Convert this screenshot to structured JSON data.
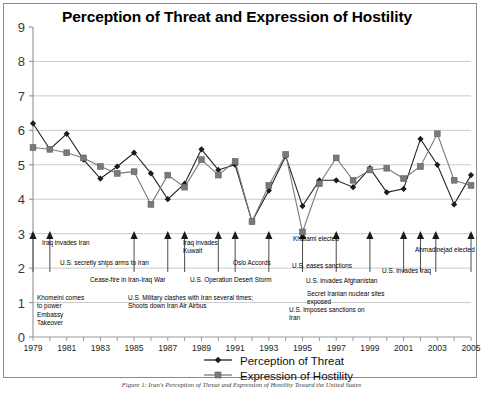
{
  "chart_data": {
    "type": "line",
    "title": "Perception of Threat and Expression of Hostility",
    "xlabel": "",
    "ylabel": "",
    "ylim": [
      0,
      9
    ],
    "xlim": [
      1979,
      2005
    ],
    "grid": true,
    "legend_position": "bottom",
    "yticks": [
      "0",
      "1",
      "2",
      "3",
      "4",
      "5",
      "6",
      "7",
      "8",
      "9"
    ],
    "xticks": [
      "1979",
      "1981",
      "1983",
      "1985",
      "1987",
      "1989",
      "1991",
      "1993",
      "1995",
      "1997",
      "1999",
      "2001",
      "2003",
      "2005"
    ],
    "x": [
      1979,
      1980,
      1981,
      1982,
      1983,
      1984,
      1985,
      1986,
      1987,
      1988,
      1989,
      1990,
      1991,
      1992,
      1993,
      1994,
      1995,
      1996,
      1997,
      1998,
      1999,
      2000,
      2001,
      2002,
      2003,
      2004,
      2005
    ],
    "series": [
      {
        "name": "Perception of Threat",
        "marker": "diamond",
        "color": "#222222",
        "values": [
          6.2,
          5.45,
          5.9,
          5.15,
          4.6,
          4.95,
          5.35,
          4.75,
          4.0,
          4.45,
          5.45,
          4.85,
          5.0,
          3.35,
          4.25,
          5.25,
          3.8,
          4.55,
          4.55,
          4.35,
          4.9,
          4.2,
          4.3,
          5.75,
          5.0,
          3.85,
          4.7
        ]
      },
      {
        "name": "Expression of Hostility",
        "marker": "square",
        "color": "#7a7a7a",
        "values": [
          5.5,
          5.45,
          5.35,
          5.2,
          4.95,
          4.75,
          4.8,
          3.85,
          4.7,
          4.35,
          5.15,
          4.7,
          5.1,
          3.35,
          4.4,
          5.3,
          3.05,
          4.45,
          5.2,
          4.55,
          4.85,
          4.9,
          4.6,
          4.95,
          5.9,
          4.55,
          4.4
        ]
      }
    ],
    "annotations": [
      {
        "label": "Iraq invades Iran",
        "year": 1980
      },
      {
        "label": "U.S. secretly ships arms to Iran",
        "year": 1985
      },
      {
        "label": "Cease-fire in Iran-Iraq War",
        "year": 1988
      },
      {
        "label": "Iraq invades Kuwait",
        "year": 1990
      },
      {
        "label": "U.S. Operation Desert Storm",
        "year": 1991
      },
      {
        "label": "Oslo Accords",
        "year": 1993
      },
      {
        "label": "Khatami elected",
        "year": 1997
      },
      {
        "label": "U.S. eases sanctions",
        "year": 1999
      },
      {
        "label": "U.S. invades Afghanistan",
        "year": 2001
      },
      {
        "label": "U.S. invades Iraq",
        "year": 2003
      },
      {
        "label": "Ahmadinejad elected",
        "year": 2005
      },
      {
        "label": "Khomeini comes to power Embassy Takeover",
        "year": 1979
      },
      {
        "label": "U.S. Military clashes with Iran several times; Shoots down Iran Air Airbus",
        "year": 1987
      },
      {
        "label": "U.S. imposes sanctions on Iran",
        "year": 1995
      },
      {
        "label": "Secret Iranian nuclear sites exposed",
        "year": 2002
      }
    ]
  },
  "caption": "Figure 1: Iran's Perception of Threat and Expression of Hostility Toward the United States"
}
